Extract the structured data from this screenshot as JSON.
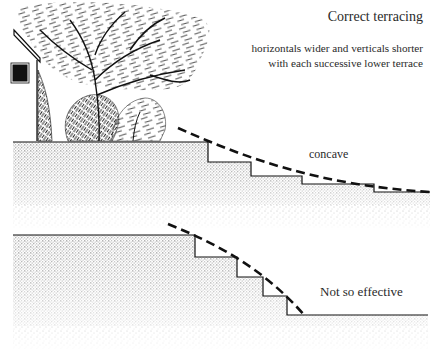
{
  "diagram": {
    "title": "Correct terracing",
    "description_lines": [
      "horizontals wider and verticals shorter",
      "with each successive lower terrace"
    ],
    "top_profile": {
      "label": "concave",
      "ground_y": 142,
      "steps": [
        {
          "x": 208,
          "from_y": 142,
          "to_y": 162
        },
        {
          "x": 251,
          "from_y": 162,
          "to_y": 176
        },
        {
          "x": 302,
          "from_y": 176,
          "to_y": 184
        },
        {
          "x": 374,
          "from_y": 184,
          "to_y": 192
        }
      ],
      "curve": "dashed concave line"
    },
    "bottom_profile": {
      "label": "Not so effective",
      "ground_y": 235,
      "steps": [
        {
          "x": 195,
          "from_y": 235,
          "to_y": 257
        },
        {
          "x": 237,
          "from_y": 257,
          "to_y": 277
        },
        {
          "x": 263,
          "from_y": 277,
          "to_y": 296
        },
        {
          "x": 287,
          "from_y": 296,
          "to_y": 315
        }
      ],
      "curve": "dashed convex line"
    },
    "illustration": {
      "elements": [
        "house-wall",
        "window",
        "tree",
        "shrubs"
      ]
    },
    "colors": {
      "ink": "#1a1a1a",
      "background": "#ffffff",
      "text": "#2a2a2a"
    }
  }
}
